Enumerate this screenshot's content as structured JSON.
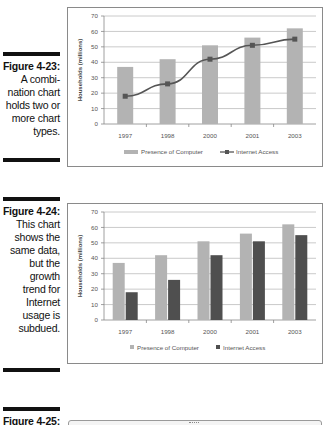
{
  "figures": [
    {
      "number": "Figure 4-23:",
      "caption_lines": [
        "A combi-",
        "nation chart",
        "holds two or",
        "more chart",
        "types."
      ]
    },
    {
      "number": "Figure 4-24:",
      "caption_lines": [
        "This chart",
        "shows the",
        "same data,",
        "but the",
        "growth",
        "trend for",
        "Internet",
        "usage is",
        "subdued."
      ]
    },
    {
      "number": "Figure 4-25:",
      "caption_lines": []
    }
  ],
  "colors": {
    "presence_bar": "#b3b3b3",
    "internet_bar": "#4f4f4f",
    "line": "#555555",
    "grid": "#bdbdbd",
    "axis_text": "#555555"
  },
  "chart_data": [
    {
      "type": "combo",
      "title": "",
      "xlabel": "",
      "ylabel": "Households (millions)",
      "ylim": [
        0,
        70
      ],
      "yticks": [
        0,
        10,
        20,
        30,
        40,
        50,
        60,
        70
      ],
      "categories": [
        "1997",
        "1998",
        "2000",
        "2001",
        "2003"
      ],
      "series": [
        {
          "name": "Presence of Computer",
          "type": "bar",
          "values": [
            37,
            42,
            51,
            56,
            62
          ]
        },
        {
          "name": "Internet Access",
          "type": "line",
          "values": [
            18,
            26,
            42,
            51,
            55
          ]
        }
      ],
      "grid": true,
      "legend_position": "bottom"
    },
    {
      "type": "bar",
      "title": "",
      "xlabel": "",
      "ylabel": "Households (millions)",
      "ylim": [
        0,
        70
      ],
      "yticks": [
        0,
        10,
        20,
        30,
        40,
        50,
        60,
        70
      ],
      "categories": [
        "1997",
        "1998",
        "2000",
        "2001",
        "2003"
      ],
      "series": [
        {
          "name": "Presence of Computer",
          "values": [
            37,
            42,
            51,
            56,
            62
          ]
        },
        {
          "name": "Internet Access",
          "values": [
            18,
            26,
            42,
            51,
            55
          ]
        }
      ],
      "grid": true,
      "legend_position": "bottom"
    }
  ]
}
